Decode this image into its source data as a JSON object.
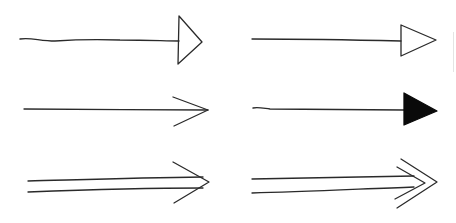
{
  "colors": {
    "background": "#ffffff",
    "ink": "#2a2a2a",
    "fill": "#0a0a0a"
  },
  "arrows": [
    {
      "name": "arrow-open-triangle-wavy",
      "style": "open triangle head, wavy shaft",
      "paths": [
        {
          "d": "M20 39 C30 37, 40 41, 55 41 C70 40, 90 39, 120 40 C150 40, 165 41, 179 41",
          "kind": "stroke"
        },
        {
          "d": "M179 16 L202 42 L178 64 Z",
          "kind": "stroke"
        }
      ]
    },
    {
      "name": "arrow-open-triangle-straight",
      "style": "open triangle head, straight shaft",
      "paths": [
        {
          "d": "M252 39 C300 39, 360 40, 401 41",
          "kind": "stroke"
        },
        {
          "d": "M401 25 L436 40 L401 56 Z",
          "kind": "stroke"
        }
      ]
    },
    {
      "name": "arrow-line-head",
      "style": "open V line head",
      "paths": [
        {
          "d": "M24 109 C80 109, 150 110, 208 110",
          "kind": "stroke"
        },
        {
          "d": "M173 97 L208 110 L174 126",
          "kind": "stroke"
        }
      ]
    },
    {
      "name": "arrow-filled-triangle",
      "style": "solid filled triangle head",
      "paths": [
        {
          "d": "M253 108 C258 107, 262 108, 270 109 C320 109, 370 110, 404 110",
          "kind": "stroke"
        },
        {
          "d": "M404 93 L437 111 L404 125 Z",
          "kind": "filled"
        }
      ]
    },
    {
      "name": "arrow-double-shaft",
      "style": "double shaft with V head",
      "paths": [
        {
          "d": "M28 181 C70 180, 130 178, 203 177",
          "kind": "stroke"
        },
        {
          "d": "M28 192 C80 190, 140 188, 203 188",
          "kind": "stroke"
        },
        {
          "d": "M173 162 L209 182 L174 203",
          "kind": "stroke"
        }
      ]
    },
    {
      "name": "arrow-double-shaft-double-head",
      "style": "double shaft with double chevron head",
      "paths": [
        {
          "d": "M252 179 C300 178, 360 177, 414 176",
          "kind": "stroke"
        },
        {
          "d": "M252 193 C300 192, 360 189, 414 187",
          "kind": "stroke"
        },
        {
          "d": "M397 167 L425 183 L395 199",
          "kind": "stroke"
        },
        {
          "d": "M401 159 L437 182 L397 208",
          "kind": "stroke"
        }
      ]
    }
  ]
}
